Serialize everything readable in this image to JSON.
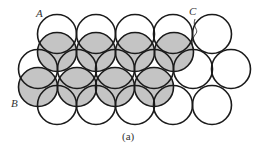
{
  "figure": {
    "caption": "(a)",
    "caption_position": {
      "x": 122,
      "y": 131
    },
    "colors": {
      "stroke": "#1a1a1a",
      "shaded_fill": "#c4c4c4",
      "open_fill": "#ffffff",
      "background": "#ffffff",
      "text": "#333333"
    },
    "circle_radius": 19.5,
    "labels": [
      {
        "id": "A",
        "text": "A",
        "x": 36,
        "y": 8
      },
      {
        "id": "B",
        "text": "B",
        "x": 11,
        "y": 98
      },
      {
        "id": "C",
        "text": "C",
        "x": 189,
        "y": 6
      }
    ],
    "leader_line_C": {
      "from": [
        195,
        19
      ],
      "to": [
        193,
        48
      ]
    },
    "open_layer": {
      "description": "bottom layer of close-packed spheres (unshaded)",
      "rows": [
        {
          "y": 34,
          "x": [
            57,
            96,
            135,
            173,
            212
          ]
        },
        {
          "y": 69,
          "x": [
            38,
            77,
            115,
            154,
            193,
            231
          ]
        },
        {
          "y": 105,
          "x": [
            57,
            96,
            135,
            173,
            212
          ]
        }
      ]
    },
    "shaded_layer": {
      "description": "second layer of spheres sitting in hollows (shaded)",
      "rows": [
        {
          "y": 52,
          "x": [
            57,
            96,
            135,
            174
          ]
        },
        {
          "y": 87,
          "x": [
            38,
            77,
            115,
            154
          ]
        }
      ]
    }
  }
}
